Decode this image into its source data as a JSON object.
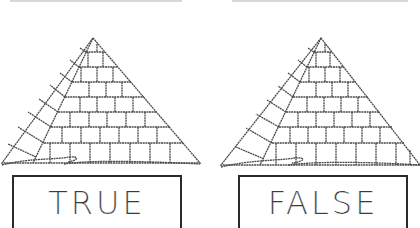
{
  "options": [
    {
      "id": "true",
      "label": "TRUE"
    },
    {
      "id": "false",
      "label": "FALSE"
    }
  ],
  "illustration": {
    "subject": "pyramid-icon",
    "stroke_color": "#555555"
  }
}
